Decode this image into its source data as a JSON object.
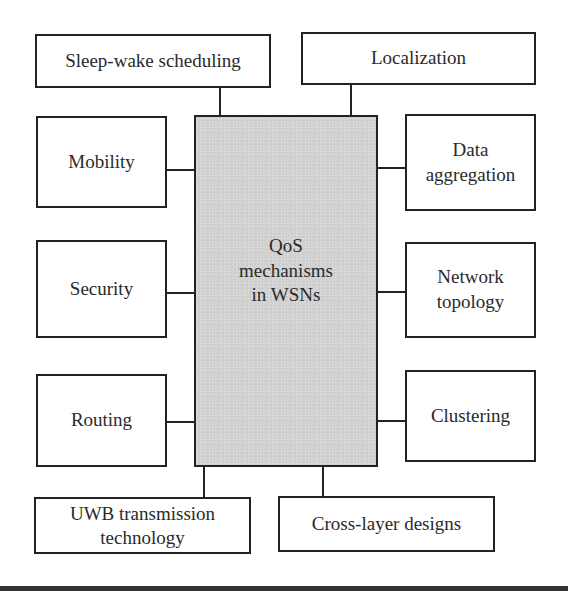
{
  "diagram": {
    "center": {
      "label": "QoS\nmechanisms\nin WSNs"
    },
    "top": [
      {
        "id": "sleep-wake",
        "label": "Sleep-wake scheduling"
      },
      {
        "id": "localization",
        "label": "Localization"
      }
    ],
    "left": [
      {
        "id": "mobility",
        "label": "Mobility"
      },
      {
        "id": "security",
        "label": "Security"
      },
      {
        "id": "routing",
        "label": "Routing"
      }
    ],
    "right": [
      {
        "id": "data-aggregation",
        "label": "Data\naggregation"
      },
      {
        "id": "network-topology",
        "label": "Network\ntopology"
      },
      {
        "id": "clustering",
        "label": "Clustering"
      }
    ],
    "bottom": [
      {
        "id": "uwb",
        "label": "UWB transmission\ntechnology"
      },
      {
        "id": "cross-layer",
        "label": "Cross-layer designs"
      }
    ],
    "colors": {
      "center_fill": "#d2d2d2",
      "border": "#222222",
      "background": "#ffffff"
    }
  }
}
